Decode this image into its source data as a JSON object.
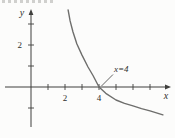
{
  "figure": {
    "axis_label_x": "x",
    "axis_label_y": "y",
    "annotation_label": "x=4"
  },
  "colors": {
    "background": "#fcfcfb",
    "axis": "#3f3f3d",
    "curve": "#6e6e6c",
    "text": "#2f2f2d"
  },
  "chart_data": {
    "type": "line",
    "title": "",
    "xlabel": "x",
    "ylabel": "y",
    "xlim": [
      -1.5,
      8.2
    ],
    "ylim": [
      -2.0,
      3.7
    ],
    "grid": false,
    "legend": false,
    "x_ticks": [
      1,
      2,
      3,
      4,
      5,
      6,
      7
    ],
    "x_tick_labels": [
      {
        "value": 2,
        "label": "2"
      },
      {
        "value": 4,
        "label": "4"
      }
    ],
    "y_ticks": [
      -1,
      1,
      2,
      3
    ],
    "y_tick_labels": [
      {
        "value": 2,
        "label": "2"
      }
    ],
    "series": [
      {
        "name": "decreasing-curve",
        "x": [
          2.18,
          2.3,
          2.47,
          2.7,
          3.0,
          3.35,
          3.65,
          4.0,
          4.4,
          5.0,
          5.5,
          6.0,
          6.5,
          7.0,
          7.76
        ],
        "y": [
          3.67,
          3.15,
          2.62,
          2.05,
          1.52,
          0.95,
          0.55,
          0.0,
          -0.3,
          -0.62,
          -0.78,
          -0.9,
          -1.03,
          -1.14,
          -1.33
        ]
      }
    ],
    "annotations": [
      {
        "text": "x=4",
        "x": 4,
        "y": 0
      }
    ]
  }
}
